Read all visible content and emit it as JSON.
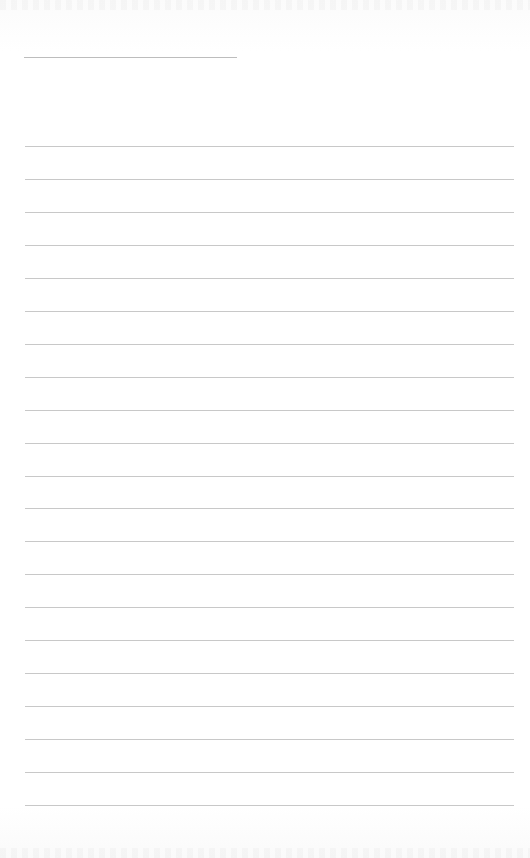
{
  "document": {
    "type": "lined-paper",
    "header_line": {
      "left": 24,
      "top": 57,
      "width": 213
    },
    "rules": {
      "count": 21,
      "first_top": 146,
      "spacing": 32.95,
      "left": 25,
      "width": 489
    },
    "colors": {
      "background": "#ffffff",
      "rule": "#c8c8c8",
      "header_line": "#bdbdbd"
    }
  }
}
